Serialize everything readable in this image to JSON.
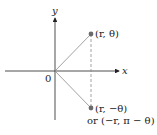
{
  "diagram": {
    "axes": {
      "x_label": "x",
      "y_label": "y",
      "origin_label": "0"
    },
    "points": [
      {
        "label": "(r, θ)"
      },
      {
        "label": "(r, −θ)",
        "alt_label": "or (−r, π − θ)"
      }
    ],
    "colors": {
      "axis": "#222222",
      "point": "#6b6b6b",
      "ray": "#8a8a8a",
      "dashed": "#8a8a8a"
    }
  }
}
